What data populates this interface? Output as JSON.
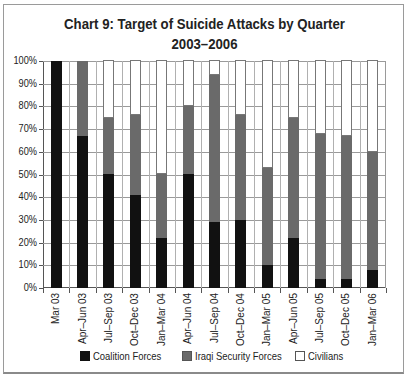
{
  "chart_data": {
    "type": "bar",
    "stacked": true,
    "normalized": true,
    "title": "Chart 9: Target of Suicide Attacks by Quarter",
    "subtitle": "2003–2006",
    "xlabel": "",
    "ylabel": "",
    "ylim": [
      0,
      100
    ],
    "y_ticks": [
      "0%",
      "10%",
      "20%",
      "30%",
      "40%",
      "50%",
      "60%",
      "70%",
      "80%",
      "90%",
      "100%"
    ],
    "grid": true,
    "legend_position": "bottom",
    "categories": [
      "Mar 03",
      "Apr–Jun 03",
      "Jul–Sep 03",
      "Oct–Dec 03",
      "Jan–Mar 04",
      "Apr–Jun 04",
      "Jul–Sep 04",
      "Oct–Dec 04",
      "Jan–Mar 05",
      "Apr–Jun 05",
      "Jul–Sep 05",
      "Oct–Dec 05",
      "Jan–Mar 06"
    ],
    "series": [
      {
        "name": "Coalition Forces",
        "color": "#111111",
        "values": [
          100,
          67,
          50,
          41,
          22,
          50,
          29,
          30,
          10,
          22,
          4,
          4,
          8
        ]
      },
      {
        "name": "Iraqi Security Forces",
        "color": "#6a6a6a",
        "values": [
          0,
          33,
          25,
          35,
          28,
          30,
          65,
          46,
          43,
          53,
          64,
          63,
          52
        ]
      },
      {
        "name": "Civilians",
        "color": "#ffffff",
        "values": [
          0,
          0,
          25,
          24,
          50,
          20,
          6,
          24,
          47,
          25,
          32,
          33,
          40
        ]
      }
    ]
  }
}
